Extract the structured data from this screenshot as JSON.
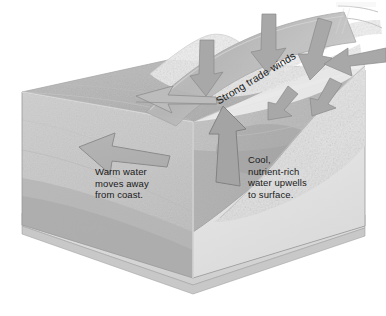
{
  "figure": {
    "background_color": "#ffffff"
  },
  "labels": {
    "warm_water": "Warm water\nmoves away\nfrom coast.",
    "cool_water": "Cool,\nnutrient-rich\nwater upwells\nto surface.",
    "trade_winds": "Strong trade winds"
  },
  "palette": {
    "water_front_face": "#c9c9c9",
    "water_surface": "#b4b4b4",
    "water_deep": "#a9a9a9",
    "arrow_fill": "#a8a8a8",
    "arrow_outline": "#6f6f6f",
    "wind_band": "#bdbdbd",
    "wind_arrow": "#a0a0a0",
    "land_sand": "#e9e9e9",
    "seafloor_slab": "#dcdcdc",
    "outline": "#8c8c8c",
    "text": "#1a1a1a"
  },
  "elements": {
    "ocean_block": "three-dimensional cut-away block of coastal ocean",
    "surface_arrow": "broad flat arrow on sea surface pointing offshore to the left",
    "offshore_arrow": "large arrow on front water face pointing left away from coast",
    "upwelling_arrow": "thick arrow rising up the continental slope toward the surface",
    "wind_band": "curved grey band sweeping across the top carrying the trade-wind label",
    "wind_arrows": "five arrows crossing the wind band toward the coast",
    "coastline": "mottled light sand landmass on the right side",
    "seafloor": "rocky slab forming the base of the block"
  }
}
